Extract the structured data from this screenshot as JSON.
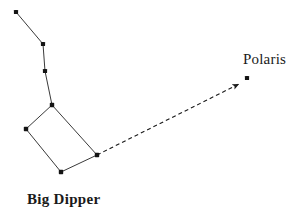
{
  "figure": {
    "type": "constellation-diagram",
    "background_color": "#ffffff",
    "ink_color": "#1a1a1a",
    "width": 302,
    "height": 224
  },
  "labels": {
    "polaris": "Polaris",
    "big_dipper": "Big Dipper"
  },
  "chart_data": {
    "type": "scatter",
    "title": "",
    "xlabel": "",
    "ylabel": "",
    "grid": false,
    "legend": "none",
    "xlim": [
      0,
      302
    ],
    "ylim": [
      224,
      0
    ],
    "annotations": [
      "Polaris",
      "Big Dipper"
    ],
    "series": [
      {
        "name": "Big Dipper stars",
        "marker": "filled-square-dot",
        "marker_color": "#141414",
        "points": [
          {
            "id": "handle-end",
            "x": 16,
            "y": 12
          },
          {
            "id": "handle-mid",
            "x": 43,
            "y": 44
          },
          {
            "id": "handle-near",
            "x": 45,
            "y": 71
          },
          {
            "id": "bowl-top",
            "x": 52,
            "y": 105
          },
          {
            "id": "bowl-left",
            "x": 26,
            "y": 129
          },
          {
            "id": "bowl-bottom",
            "x": 61,
            "y": 172
          },
          {
            "id": "bowl-right",
            "x": 97,
            "y": 155
          }
        ]
      },
      {
        "name": "Polaris",
        "marker": "filled-square-dot",
        "marker_color": "#141414",
        "points": [
          {
            "id": "polaris",
            "x": 247,
            "y": 78
          }
        ]
      }
    ],
    "connections": {
      "style": "solid",
      "color": "#3a3a3a",
      "width": 1,
      "segments": [
        [
          "handle-end",
          "handle-mid"
        ],
        [
          "handle-mid",
          "handle-near"
        ],
        [
          "handle-near",
          "bowl-top"
        ],
        [
          "bowl-top",
          "bowl-left"
        ],
        [
          "bowl-left",
          "bowl-bottom"
        ],
        [
          "bowl-bottom",
          "bowl-right"
        ],
        [
          "bowl-right",
          "bowl-top"
        ]
      ]
    },
    "pointer": {
      "style": "dashed",
      "color": "#1a1a1a",
      "width": 1,
      "dash": "4 3",
      "from": {
        "x": 97,
        "y": 155
      },
      "to": {
        "x": 241,
        "y": 83
      },
      "arrowhead": true,
      "target_label": "Polaris"
    }
  }
}
